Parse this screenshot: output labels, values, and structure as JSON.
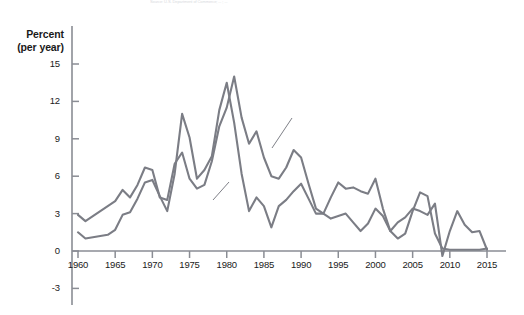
{
  "figure": {
    "source_note": "Source: U.S. Department of Commerce; ... ; ...",
    "axis_title_line1": "Percent",
    "axis_title_line2": "(per year)"
  },
  "chart_data": {
    "type": "line",
    "title": "",
    "xlabel": "",
    "ylabel": "Percent (per year)",
    "xlim": [
      1959,
      2016
    ],
    "ylim": [
      -4,
      16.5
    ],
    "yticks": [
      15,
      12,
      9,
      6,
      3,
      0,
      -3
    ],
    "ytick_labels": [
      "15",
      "12",
      "9",
      "6",
      "3",
      "0",
      "-3"
    ],
    "xticks": [
      1960,
      1965,
      1970,
      1975,
      1980,
      1985,
      1990,
      1995,
      2000,
      2005,
      2010,
      2015
    ],
    "xtick_labels": [
      "1960",
      "1965",
      "1970",
      "1975",
      "1980",
      "1985",
      "1990",
      "1995",
      "2000",
      "2005",
      "2010",
      "2015"
    ],
    "grid": false,
    "legend_position": "inline-annotations",
    "annotations": [
      {
        "text": "Nominal interest rate",
        "x": 1987.5,
        "y": 10.4
      },
      {
        "text": "Inflation",
        "x": 1974.5,
        "y": 1.6
      }
    ],
    "line_color": "#7b7d85",
    "line_width": 2.1,
    "x": [
      1960,
      1961,
      1962,
      1963,
      1964,
      1965,
      1966,
      1967,
      1968,
      1969,
      1970,
      1971,
      1972,
      1973,
      1974,
      1975,
      1976,
      1977,
      1978,
      1979,
      1980,
      1981,
      1982,
      1983,
      1984,
      1985,
      1986,
      1987,
      1988,
      1989,
      1990,
      1991,
      1992,
      1993,
      1994,
      1995,
      1996,
      1997,
      1998,
      1999,
      2000,
      2001,
      2002,
      2003,
      2004,
      2005,
      2006,
      2007,
      2008,
      2009,
      2010,
      2011,
      2012,
      2013,
      2014,
      2015
    ],
    "series": [
      {
        "name": "Nominal interest rate",
        "values": [
          2.9,
          2.4,
          2.8,
          3.2,
          3.6,
          4.0,
          4.9,
          4.3,
          5.3,
          6.7,
          6.5,
          4.3,
          4.1,
          7.0,
          7.9,
          5.8,
          5.0,
          5.3,
          7.2,
          10.0,
          11.5,
          14.0,
          10.7,
          8.6,
          9.6,
          7.5,
          6.0,
          5.8,
          6.7,
          8.1,
          7.5,
          5.4,
          3.4,
          3.0,
          4.3,
          5.5,
          5.0,
          5.1,
          4.8,
          4.6,
          5.8,
          3.4,
          1.6,
          1.0,
          1.4,
          3.2,
          4.7,
          4.4,
          1.4,
          0.2,
          0.1,
          0.1,
          0.1,
          0.1,
          0.1,
          0.2
        ]
      },
      {
        "name": "Inflation",
        "values": [
          1.5,
          1.0,
          1.1,
          1.2,
          1.3,
          1.7,
          2.9,
          3.1,
          4.2,
          5.5,
          5.7,
          4.4,
          3.2,
          6.2,
          11.0,
          9.1,
          5.8,
          6.5,
          7.6,
          11.3,
          13.5,
          10.3,
          6.2,
          3.2,
          4.3,
          3.6,
          1.9,
          3.6,
          4.1,
          4.8,
          5.4,
          4.2,
          3.0,
          3.0,
          2.6,
          2.8,
          3.0,
          2.3,
          1.6,
          2.2,
          3.4,
          2.8,
          1.6,
          2.3,
          2.7,
          3.4,
          3.2,
          2.9,
          3.8,
          -0.4,
          1.6,
          3.2,
          2.1,
          1.5,
          1.6,
          0.1
        ]
      }
    ]
  }
}
